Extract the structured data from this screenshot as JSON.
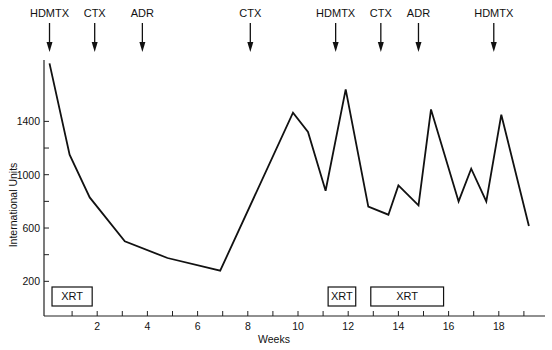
{
  "chart_data": {
    "type": "line",
    "title": "",
    "xlabel": "Weeks",
    "ylabel": "International Units",
    "xlim": [
      0,
      20
    ],
    "ylim": [
      0,
      1900
    ],
    "x_ticks": [
      1,
      2,
      3,
      4,
      5,
      6,
      7,
      8,
      9,
      10,
      11,
      12,
      13,
      14,
      15,
      16,
      17,
      18,
      19
    ],
    "x_tick_labels": [
      "2",
      "4",
      "6",
      "8",
      "10",
      "12",
      "14",
      "16",
      "18"
    ],
    "x_tick_label_values": [
      2,
      4,
      6,
      8,
      10,
      12,
      14,
      16,
      18
    ],
    "y_tick_values": [
      200,
      400,
      600,
      800,
      1000,
      1200,
      1400
    ],
    "y_tick_labels": [
      "200",
      "600",
      "1000",
      "1400"
    ],
    "y_tick_label_values": [
      200,
      600,
      1000,
      1400
    ],
    "grid": false,
    "legend": null,
    "series": [
      {
        "name": "International Units",
        "x": [
          0.1,
          0.9,
          1.7,
          3.1,
          4.8,
          6.9,
          9.8,
          10.4,
          11.1,
          11.9,
          12.8,
          13.6,
          14.0,
          14.8,
          15.3,
          16.4,
          16.9,
          17.5,
          18.1,
          19.2
        ],
        "values": [
          1835,
          1150,
          830,
          500,
          375,
          280,
          1465,
          1320,
          880,
          1640,
          760,
          700,
          920,
          770,
          1490,
          800,
          1045,
          800,
          1450,
          615
        ]
      }
    ],
    "annotations": {
      "drug_arrows": [
        {
          "label": "HDMTX",
          "week": 0.1
        },
        {
          "label": "CTX",
          "week": 1.9
        },
        {
          "label": "ADR",
          "week": 3.8
        },
        {
          "label": "CTX",
          "week": 8.1
        },
        {
          "label": "HDMTX",
          "week": 11.5
        },
        {
          "label": "CTX",
          "week": 13.3
        },
        {
          "label": "ADR",
          "week": 14.8
        },
        {
          "label": "HDMTX",
          "week": 17.8
        }
      ],
      "xrt_boxes": [
        {
          "label": "XRT",
          "start_week": 0.2,
          "end_week": 1.8
        },
        {
          "label": "XRT",
          "start_week": 11.2,
          "end_week": 12.3
        },
        {
          "label": "XRT",
          "start_week": 12.9,
          "end_week": 15.8
        }
      ]
    }
  },
  "axes": {
    "xlabel": "Weeks",
    "ylabel": "International Units"
  }
}
